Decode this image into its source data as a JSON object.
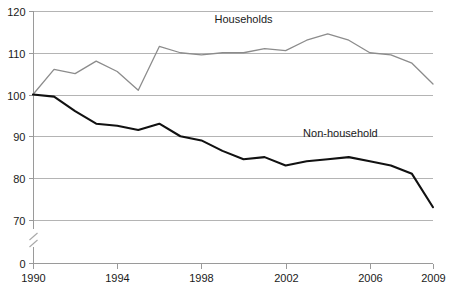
{
  "chart_data": {
    "type": "line",
    "title": "",
    "xlabel": "",
    "ylabel": "",
    "x": [
      1990,
      1991,
      1992,
      1993,
      1994,
      1995,
      1996,
      1997,
      1998,
      1999,
      2000,
      2001,
      2002,
      2003,
      2004,
      2005,
      2006,
      2007,
      2008,
      2009
    ],
    "xlim": [
      1990,
      2009
    ],
    "ylim": [
      65,
      120
    ],
    "y_axis_break": true,
    "y_break_between": [
      0,
      70
    ],
    "grid": "horizontal",
    "legend": "inline-labels",
    "xtick_labels": [
      "1990",
      "1994",
      "1998",
      "2002",
      "2006",
      "2009"
    ],
    "xtick_values": [
      1990,
      1994,
      1998,
      2002,
      2006,
      2009
    ],
    "ytick_labels": [
      "120",
      "110",
      "100",
      "90",
      "80",
      "70",
      "0"
    ],
    "ytick_values": [
      120,
      110,
      100,
      90,
      80,
      70,
      0
    ],
    "series": [
      {
        "name": "Households",
        "color": "#8c8c8c",
        "label_x": 2000,
        "label_y": 117.2,
        "values": [
          100,
          106,
          105,
          108,
          105.5,
          101,
          111.5,
          110,
          109.5,
          110,
          110,
          111,
          110.5,
          113,
          114.5,
          113,
          110,
          109.5,
          107.5,
          102.5
        ]
      },
      {
        "name": "Non-household",
        "color": "#111111",
        "label_x": 2004.6,
        "label_y": 89.8,
        "values": [
          100,
          99.5,
          96,
          93,
          92.5,
          91.5,
          93,
          90,
          89,
          86.5,
          84.5,
          85,
          83,
          84,
          84.5,
          85,
          84,
          83,
          81,
          73
        ]
      }
    ]
  }
}
